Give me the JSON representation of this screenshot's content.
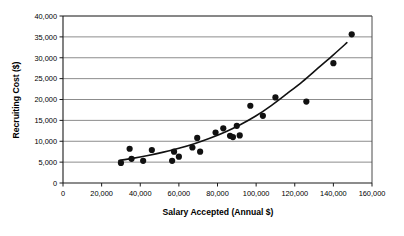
{
  "chart_data": {
    "type": "scatter",
    "title": "",
    "xlabel": "Salary Accepted (Annual $)",
    "ylabel": "Recruiting Cost ($)",
    "xlim": [
      0,
      160000
    ],
    "ylim": [
      0,
      40000
    ],
    "xticks": [
      0,
      20000,
      40000,
      60000,
      80000,
      100000,
      120000,
      140000,
      160000
    ],
    "yticks": [
      0,
      5000,
      10000,
      15000,
      20000,
      25000,
      30000,
      35000,
      40000
    ],
    "xtick_labels": [
      "0",
      "20,000",
      "40,000",
      "60,000",
      "80,000",
      "100,000",
      "120,000",
      "140,000",
      "160,000"
    ],
    "ytick_labels": [
      "0",
      "5,000",
      "10,000",
      "15,000",
      "20,000",
      "25,000",
      "30,000",
      "35,000",
      "40,000"
    ],
    "grid": "horizontal",
    "legend": "none",
    "marker": "filled-circle",
    "marker_color": "#111111",
    "series": [
      {
        "name": "Recruiting cost vs salary",
        "points": [
          [
            30000,
            4800
          ],
          [
            34500,
            8200
          ],
          [
            35500,
            5800
          ],
          [
            41500,
            5300
          ],
          [
            46000,
            7900
          ],
          [
            56500,
            5300
          ],
          [
            57500,
            7500
          ],
          [
            60000,
            6300
          ],
          [
            67000,
            8500
          ],
          [
            69500,
            10800
          ],
          [
            71000,
            7500
          ],
          [
            79000,
            12100
          ],
          [
            83000,
            13100
          ],
          [
            86500,
            11300
          ],
          [
            88000,
            11000
          ],
          [
            90000,
            13700
          ],
          [
            91500,
            11400
          ],
          [
            97000,
            18500
          ],
          [
            103500,
            16100
          ],
          [
            110000,
            20500
          ],
          [
            126000,
            19500
          ],
          [
            140000,
            28700
          ],
          [
            149500,
            35600
          ]
        ]
      }
    ],
    "trendline": {
      "name": "exponential fit",
      "style": "solid",
      "color": "#111111",
      "points": [
        [
          29000,
          5400
        ],
        [
          36000,
          5900
        ],
        [
          44000,
          6600
        ],
        [
          52000,
          7400
        ],
        [
          60000,
          8300
        ],
        [
          68000,
          9400
        ],
        [
          76000,
          10700
        ],
        [
          84000,
          12200
        ],
        [
          92000,
          14000
        ],
        [
          100000,
          16100
        ],
        [
          108000,
          18600
        ],
        [
          116000,
          21400
        ],
        [
          124000,
          24300
        ],
        [
          132000,
          27500
        ],
        [
          140000,
          30700
        ],
        [
          147000,
          33600
        ]
      ]
    }
  },
  "axes": {
    "x_title": "Salary Accepted (Annual $)",
    "y_title": "Recruiting Cost ($)"
  }
}
